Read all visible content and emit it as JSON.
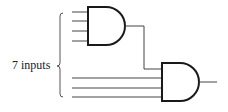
{
  "diagram": {
    "type": "logic-circuit",
    "label": "7 inputs",
    "colors": {
      "stroke": "#1a1a1a",
      "wire": "#444444",
      "background": "#ffffff"
    },
    "gates": [
      {
        "id": "and-gate-1",
        "type": "AND",
        "inputs": 4
      },
      {
        "id": "and-gate-2",
        "type": "AND",
        "inputs": 4
      }
    ],
    "connections": [
      {
        "from": "and-gate-1.output",
        "to": "and-gate-2.input-1"
      }
    ],
    "external_inputs": 7,
    "outputs": 1
  }
}
